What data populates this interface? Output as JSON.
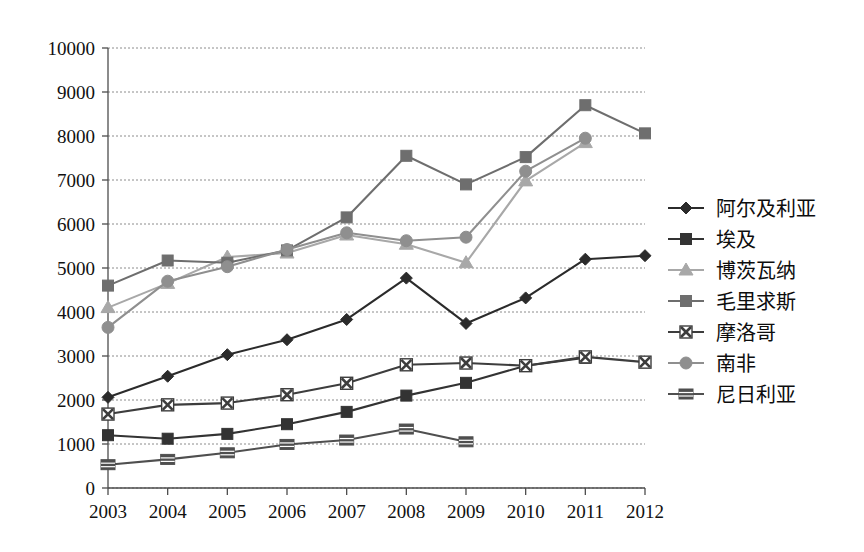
{
  "chart_data": {
    "type": "line",
    "title": "",
    "xlabel": "",
    "ylabel": "",
    "categories": [
      "2003",
      "2004",
      "2005",
      "2006",
      "2007",
      "2008",
      "2009",
      "2010",
      "2011",
      "2012"
    ],
    "x": [
      2003,
      2004,
      2005,
      2006,
      2007,
      2008,
      2009,
      2010,
      2011,
      2012
    ],
    "ylim": [
      0,
      10000
    ],
    "xlim": [
      2003,
      2012
    ],
    "ytick_labels": [
      "0",
      "1000",
      "2000",
      "3000",
      "4000",
      "5000",
      "6000",
      "7000",
      "8000",
      "9000",
      "10000"
    ],
    "ytick_values": [
      0,
      1000,
      2000,
      3000,
      4000,
      5000,
      6000,
      7000,
      8000,
      9000,
      10000
    ],
    "ytick_step": 1000,
    "grid": true,
    "grid_axis": "y",
    "legend_position": "right",
    "series": [
      {
        "name": "阿尔及利亚",
        "marker": "diamond",
        "color": "#2b2b2b",
        "values": [
          2060,
          2540,
          3030,
          3370,
          3830,
          4770,
          3740,
          4320,
          5200,
          5280
        ]
      },
      {
        "name": "埃及",
        "marker": "square",
        "color": "#333333",
        "values": [
          1200,
          1120,
          1230,
          1450,
          1730,
          2100,
          2390,
          2780,
          2960,
          null
        ]
      },
      {
        "name": "博茨瓦纳",
        "marker": "triangle",
        "color": "#a8a8a8",
        "values": [
          4100,
          4650,
          5250,
          5340,
          5750,
          5540,
          5120,
          6980,
          7850,
          null
        ]
      },
      {
        "name": "毛里求斯",
        "marker": "square",
        "color": "#6e6e6e",
        "values": [
          4600,
          5170,
          5120,
          5400,
          6150,
          7550,
          6900,
          7520,
          8700,
          8060
        ]
      },
      {
        "name": "摩洛哥",
        "marker": "x-box",
        "color": "#3d3d3d",
        "values": [
          1680,
          1890,
          1930,
          2120,
          2380,
          2800,
          2840,
          2780,
          2980,
          2860
        ]
      },
      {
        "name": "南非",
        "marker": "circle",
        "color": "#8f8f8f",
        "values": [
          3650,
          4700,
          5030,
          5420,
          5800,
          5620,
          5700,
          7200,
          7950,
          null
        ]
      },
      {
        "name": "尼日利亚",
        "marker": "bar",
        "color": "#4f4f4f",
        "values": [
          530,
          650,
          800,
          990,
          1090,
          1340,
          1050,
          null,
          null,
          null
        ]
      }
    ]
  },
  "legend": {
    "items": [
      {
        "label": "阿尔及利亚",
        "marker": "diamond-marker",
        "color": "#2b2b2b"
      },
      {
        "label": "埃及",
        "marker": "square-marker",
        "color": "#333333"
      },
      {
        "label": "博茨瓦纳",
        "marker": "triangle-marker",
        "color": "#a8a8a8"
      },
      {
        "label": "毛里求斯",
        "marker": "square-marker",
        "color": "#6e6e6e"
      },
      {
        "label": "摩洛哥",
        "marker": "x-box-marker",
        "color": "#3d3d3d"
      },
      {
        "label": "南非",
        "marker": "circle-marker",
        "color": "#8f8f8f"
      },
      {
        "label": "尼日利亚",
        "marker": "bar-marker",
        "color": "#4f4f4f"
      }
    ]
  },
  "colors": {
    "background": "#ffffff",
    "grid": "#8c8c8c",
    "axis": "#4d4d4d",
    "text": "#111111"
  }
}
